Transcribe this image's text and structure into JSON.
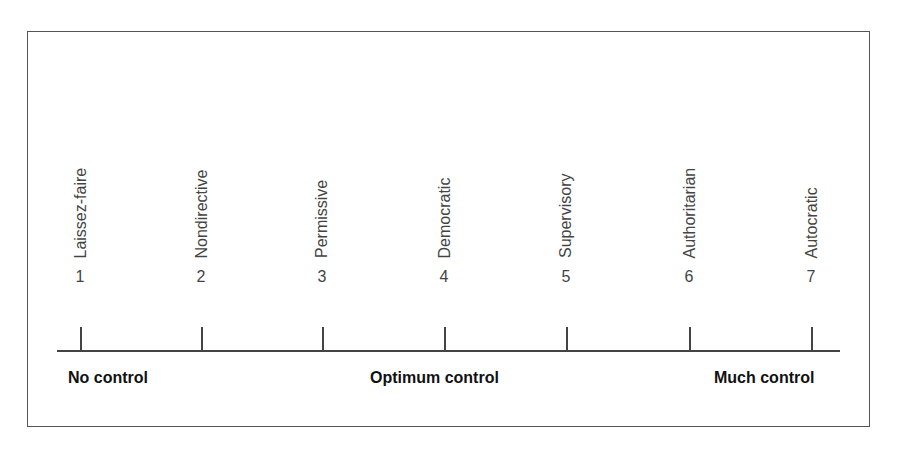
{
  "diagram": {
    "type": "continuum-scale",
    "points": [
      {
        "number": "1",
        "label": "Laissez-faire",
        "x": 80
      },
      {
        "number": "2",
        "label": "Nondirective",
        "x": 201
      },
      {
        "number": "3",
        "label": "Permissive",
        "x": 322
      },
      {
        "number": "4",
        "label": "Democratic",
        "x": 444
      },
      {
        "number": "5",
        "label": "Supervisory",
        "x": 566
      },
      {
        "number": "6",
        "label": "Authoritarian",
        "x": 689
      },
      {
        "number": "7",
        "label": "Autocratic",
        "x": 811
      }
    ],
    "anchors": {
      "left": "No control",
      "center": "Optimum control",
      "right": "Much control"
    }
  }
}
